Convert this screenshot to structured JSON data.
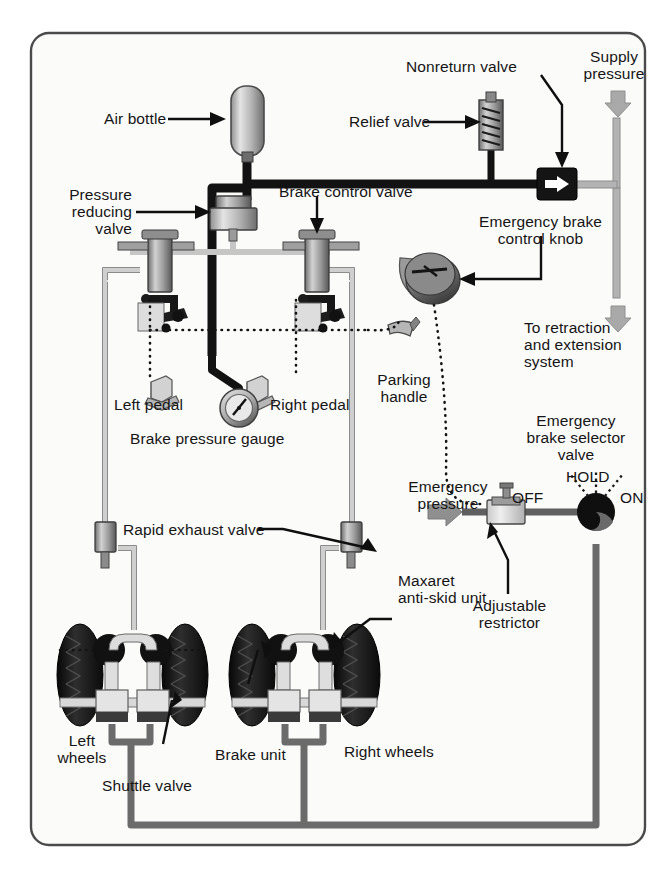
{
  "figure": {
    "border_color": "#4d4d4d",
    "background": "#fbfbfa"
  },
  "colors": {
    "supply_pipe": "#111111",
    "brake_pipe": "#a8a8a8",
    "return_pipe": "#6e6e6e",
    "emergency_pipe": "#5a5a5a",
    "arrow_grey": "#a0a0a0",
    "metal_light": "#d9d9d9",
    "metal_mid": "#9a9a9a",
    "metal_dark": "#555555",
    "tyre": "#1c1c1c",
    "label_text": "#151515"
  },
  "labels": {
    "air_bottle": "Air bottle",
    "relief_valve": "Relief valve",
    "nonreturn_valve": "Nonreturn valve",
    "supply_pressure": "Supply\npressure",
    "pressure_reducing_valve": "Pressure\nreducing\nvalve",
    "brake_control_valve": "Brake control valve",
    "emergency_brake_control_knob": "Emergency brake\ncontrol knob",
    "to_retraction_and_extension_system": "To retraction\nand extension\nsystem",
    "parking_handle": "Parking\nhandle",
    "left_pedal": "Left pedal",
    "right_pedal": "Right pedal",
    "brake_pressure_gauge": "Brake pressure gauge",
    "emergency_brake_selector_valve": "Emergency\nbrake selector\nvalve",
    "selector_hold": "HOLD",
    "selector_off": "OFF",
    "selector_on": "ON",
    "emergency_pressure": "Emergency\npressure",
    "rapid_exhaust_valve": "Rapid exhaust valve",
    "maxaret_anti_skid_unit": "Maxaret\nanti-skid unit",
    "adjustable_restrictor": "Adjustable\nrestrictor",
    "left_wheels": "Left\nwheels",
    "right_wheels": "Right wheels",
    "brake_unit": "Brake unit",
    "shuttle_valve": "Shuttle valve"
  },
  "components": [
    {
      "name": "air-bottle",
      "label": "Air bottle",
      "x": 235,
      "y": 90
    },
    {
      "name": "relief-valve",
      "label": "Relief valve",
      "x": 492,
      "y": 100
    },
    {
      "name": "nonreturn-valve",
      "label": "Nonreturn valve",
      "x": 556,
      "y": 177
    },
    {
      "name": "pressure-reducing-valve",
      "label": "Pressure reducing valve",
      "x": 233,
      "y": 212
    },
    {
      "name": "brake-control-valve-left",
      "label": "Brake control valve",
      "x": 160,
      "y": 245
    },
    {
      "name": "brake-control-valve-right",
      "label": "Brake control valve",
      "x": 317,
      "y": 245
    },
    {
      "name": "emergency-brake-control-knob",
      "label": "Emergency brake control knob",
      "x": 430,
      "y": 278
    },
    {
      "name": "parking-handle",
      "label": "Parking handle",
      "x": 404,
      "y": 345
    },
    {
      "name": "left-pedal",
      "label": "Left pedal",
      "x": 165,
      "y": 395
    },
    {
      "name": "right-pedal",
      "label": "Right pedal",
      "x": 257,
      "y": 395
    },
    {
      "name": "brake-pressure-gauge",
      "label": "Brake pressure gauge",
      "x": 215,
      "y": 412
    },
    {
      "name": "rapid-exhaust-valve-left",
      "label": "Rapid exhaust valve",
      "x": 118,
      "y": 528
    },
    {
      "name": "rapid-exhaust-valve-right",
      "label": "Rapid exhaust valve",
      "x": 364,
      "y": 528
    },
    {
      "name": "adjustable-restrictor",
      "label": "Adjustable restrictor",
      "x": 508,
      "y": 535
    },
    {
      "name": "emergency-brake-selector-valve",
      "label": "Emergency brake selector valve",
      "x": 573,
      "y": 537
    },
    {
      "name": "maxaret-anti-skid-unit",
      "label": "Maxaret anti-skid unit",
      "x": 372,
      "y": 645
    },
    {
      "name": "shuttle-valve",
      "label": "Shuttle valve",
      "x": 137,
      "y": 700
    },
    {
      "name": "brake-unit",
      "label": "Brake unit",
      "x": 248,
      "y": 700
    }
  ],
  "selector_positions": [
    "OFF",
    "HOLD",
    "ON"
  ],
  "flow_arrows": [
    {
      "name": "supply-pressure-in",
      "direction": "down",
      "x": 618,
      "y": 100
    },
    {
      "name": "to-retraction-out",
      "direction": "down",
      "x": 618,
      "y": 285
    },
    {
      "name": "emergency-pressure-in",
      "direction": "right",
      "x": 443,
      "y": 510
    }
  ]
}
